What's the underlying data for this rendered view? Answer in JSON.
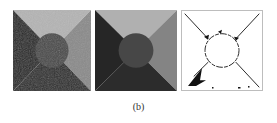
{
  "figure": {
    "caption": "(b)",
    "panels": [
      {
        "id": "original",
        "description": "noisy synthetic image: dark disk over four shaded triangular regions"
      },
      {
        "id": "segmented",
        "description": "piecewise-constant segmentation result"
      },
      {
        "id": "edges",
        "description": "binary edge map of segmentation boundaries"
      }
    ],
    "colors": {
      "top": "#b4b4b4",
      "right": "#8a8a8a",
      "left": "#232323",
      "bottom": "#2e2e2e",
      "disk": "#484848",
      "edge": "#111111",
      "background": "#ffffff"
    }
  }
}
